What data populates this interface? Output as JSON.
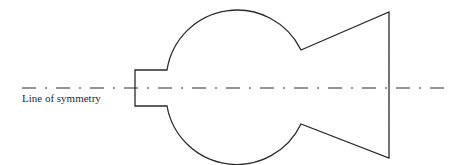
{
  "diagram": {
    "type": "symmetric-shape-with-axis",
    "label": "Line of symmetry",
    "colors": {
      "stroke": "#2a2a2a",
      "background": "#ffffff"
    },
    "shape": {
      "description": "Outline composed of a rectangular stem on the left, a large circle in the middle, and a trapezoidal flared section on the right, mirrored about a horizontal axis",
      "stem": {
        "left_x": 135,
        "top_y": 70,
        "bottom_y": 106
      },
      "circle": {
        "cx": 242,
        "cy": 87,
        "r": 71
      },
      "notch_top": [
        301,
        50
      ],
      "notch_bottom": [
        301,
        124
      ],
      "right_edge": {
        "x": 389,
        "top_y": 12,
        "bottom_y": 158
      }
    },
    "axis": {
      "y": 88,
      "x_start": 22,
      "x_end": 440,
      "style": "dash-dot"
    }
  }
}
